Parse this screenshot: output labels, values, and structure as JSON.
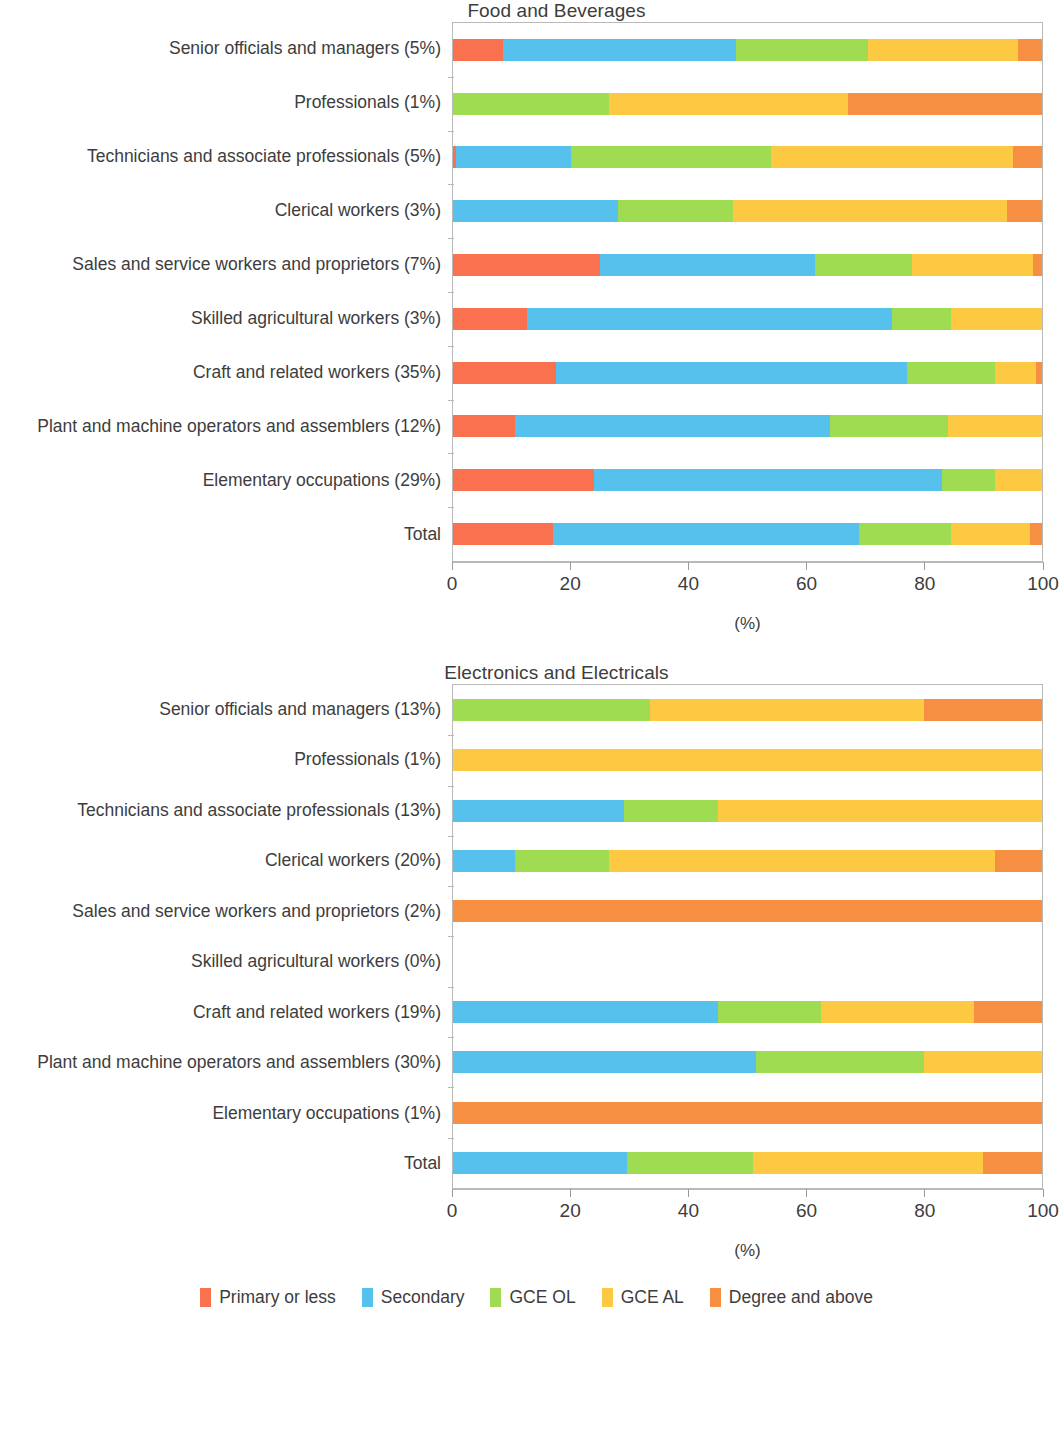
{
  "legend": {
    "position": "bottom-center",
    "items": [
      {
        "label": "Primary or less",
        "color": "#fa7150"
      },
      {
        "label": "Secondary",
        "color": "#57c1ee"
      },
      {
        "label": "GCE OL",
        "color": "#9fdc52"
      },
      {
        "label": "GCE AL",
        "color": "#fdc943"
      },
      {
        "label": "Degree and above",
        "color": "#f78f42"
      }
    ]
  },
  "axis": {
    "unit": "(%)",
    "ticks": [
      "0",
      "20",
      "40",
      "60",
      "80",
      "100"
    ],
    "tick_values": [
      0,
      20,
      40,
      60,
      80,
      100
    ],
    "min": 0,
    "max": 100
  },
  "charts": [
    {
      "title": "Food and Beverages"
    },
    {
      "title": "Electronics and Electricals"
    }
  ],
  "chart_data": [
    {
      "type": "bar",
      "orientation": "horizontal",
      "stacked": true,
      "normalized_percent": true,
      "title": "Food and Beverages",
      "xlabel": "(%)",
      "ylabel": "",
      "xlim": [
        0,
        100
      ],
      "grid": false,
      "legend_position": "bottom",
      "series": [
        {
          "name": "Primary or less",
          "color": "#fa7150",
          "values": [
            8.5,
            0.0,
            0.5,
            0.0,
            25.0,
            12.5,
            17.5,
            10.5,
            24.0,
            17.0
          ]
        },
        {
          "name": "Secondary",
          "color": "#57c1ee",
          "values": [
            39.5,
            0.0,
            19.5,
            28.0,
            36.5,
            62.0,
            59.5,
            53.5,
            59.0,
            52.0
          ]
        },
        {
          "name": "GCE OL",
          "color": "#9fdc52",
          "values": [
            22.5,
            26.5,
            34.0,
            19.5,
            16.5,
            10.0,
            15.0,
            20.0,
            9.0,
            15.5
          ]
        },
        {
          "name": "GCE AL",
          "color": "#fdc943",
          "values": [
            25.5,
            40.5,
            41.0,
            46.5,
            20.5,
            15.5,
            7.0,
            16.0,
            8.0,
            13.5
          ]
        },
        {
          "name": "Degree and above",
          "color": "#f78f42",
          "values": [
            4.0,
            33.0,
            5.0,
            6.0,
            1.5,
            0.0,
            1.0,
            0.0,
            0.0,
            2.0
          ]
        }
      ],
      "categories": [
        "Senior officials and managers  (5%)",
        "Professionals (1%)",
        "Technicians and associate professionals (5%)",
        "Clerical workers (3%)",
        "Sales and service workers and proprietors (7%)",
        "Skilled agricultural workers (3%)",
        "Craft and related workers (35%)",
        "Plant and machine operators and assemblers (12%)",
        "Elementary occupations (29%)",
        "Total"
      ]
    },
    {
      "type": "bar",
      "orientation": "horizontal",
      "stacked": true,
      "normalized_percent": true,
      "title": "Electronics and Electricals",
      "xlabel": "(%)",
      "ylabel": "",
      "xlim": [
        0,
        100
      ],
      "grid": false,
      "legend_position": "bottom",
      "series": [
        {
          "name": "Primary or less",
          "color": "#fa7150",
          "values": [
            0.0,
            0.0,
            0.0,
            0.0,
            0.0,
            0.0,
            0.0,
            0.0,
            0.0,
            0.0
          ]
        },
        {
          "name": "Secondary",
          "color": "#57c1ee",
          "values": [
            0.0,
            0.0,
            29.0,
            10.5,
            0.0,
            0.0,
            45.0,
            51.5,
            0.0,
            29.5
          ]
        },
        {
          "name": "GCE OL",
          "color": "#9fdc52",
          "values": [
            33.5,
            0.0,
            16.0,
            16.0,
            0.0,
            0.0,
            17.5,
            28.5,
            0.0,
            21.5
          ]
        },
        {
          "name": "GCE AL",
          "color": "#fdc943",
          "values": [
            46.5,
            100.0,
            55.0,
            65.5,
            0.0,
            0.0,
            26.0,
            20.0,
            0.0,
            39.0
          ]
        },
        {
          "name": "Degree and above",
          "color": "#f78f42",
          "values": [
            20.0,
            0.0,
            0.0,
            8.0,
            100.0,
            0.0,
            11.5,
            0.0,
            100.0,
            10.0
          ]
        }
      ],
      "categories": [
        "Senior officials and managers  (13%)",
        "Professionals (1%)",
        "Technicians and associate professionals (13%)",
        "Clerical workers (20%)",
        "Sales and service workers and proprietors (2%)",
        "Skilled agricultural workers (0%)",
        "Craft and related workers (19%)",
        "Plant and machine operators and assemblers (30%)",
        "Elementary occupations (1%)",
        "Total"
      ]
    }
  ]
}
